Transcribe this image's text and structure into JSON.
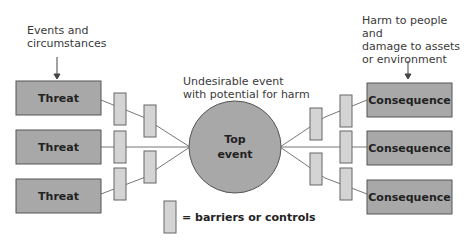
{
  "annotations": {
    "left": "Events and circumstances",
    "left_line1": "Events and",
    "left_line2": "circumstances",
    "center_line1": "Undesirable event",
    "center_line2": "with potential for harm",
    "right_line1": "Harm to people and",
    "right_line2": "damage to assets",
    "right_line3": "or environment"
  },
  "threats": [
    {
      "label": "Threat"
    },
    {
      "label": "Threat"
    },
    {
      "label": "Threat"
    }
  ],
  "top_event": {
    "line1": "Top",
    "line2": "event"
  },
  "consequences": [
    {
      "label": "Consequence"
    },
    {
      "label": "Consequence"
    },
    {
      "label": "Consequence"
    }
  ],
  "legend": {
    "label": "= barriers or controls"
  },
  "colors": {
    "box_fill": "#a8a8a8",
    "box_stroke": "#555555",
    "barrier_fill": "#d4d4d4",
    "barrier_stroke": "#666666",
    "circle_fill": "#a8a8a8",
    "line": "#777777"
  }
}
